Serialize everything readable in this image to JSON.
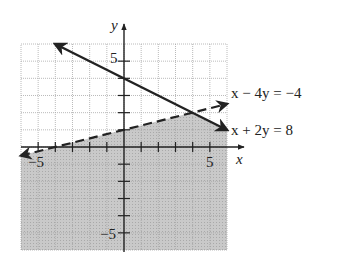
{
  "chart_data": {
    "type": "line",
    "title": "",
    "xlabel": "x",
    "ylabel": "y",
    "xlim": [
      -6,
      6
    ],
    "ylim": [
      -6,
      6
    ],
    "grid": true,
    "tick_labels": {
      "x": [
        "-5",
        "5"
      ],
      "y": [
        "5",
        "-5"
      ]
    },
    "series": [
      {
        "name": "x + 2y = 8",
        "style": "solid",
        "equation": "y = 4 - x/2",
        "points": [
          [
            -4,
            6
          ],
          [
            6,
            1
          ]
        ],
        "arrows": "both"
      },
      {
        "name": "x - 4y = -4",
        "style": "dashed",
        "equation": "y = 1 + x/4",
        "points": [
          [
            -6,
            -0.5
          ],
          [
            6,
            2.5
          ]
        ],
        "arrows": "both"
      }
    ],
    "shaded_region": {
      "description": "below both lines",
      "inequalities": [
        "x + 2y < 8",
        "x - 4y > -4"
      ],
      "vertex": [
        4,
        2
      ],
      "color": "#c8c8c8"
    }
  },
  "labels": {
    "x_axis": "x",
    "y_axis": "y",
    "tick_x_neg": "−5",
    "tick_x_pos": "5",
    "tick_y_pos": "5",
    "tick_y_neg": "−5",
    "eq_dashed": "x − 4y = −4",
    "eq_solid": "x + 2y = 8"
  },
  "colors": {
    "shade": "#c4c4c4",
    "line": "#222222",
    "grid": "#b0b0b0"
  }
}
